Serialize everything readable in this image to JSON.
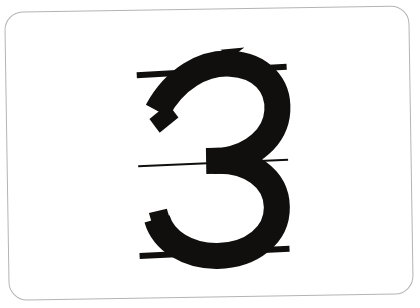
{
  "card": {
    "name": "handwriting-practice-flashcard",
    "subject": "numeral-3-stroke-order",
    "background_color": "#ffffff",
    "border_color": "#b4b4b4",
    "border_width": 1,
    "corner_radius": 18,
    "rotation_degrees": -0.9,
    "bounds": {
      "x": 7,
      "y": 9,
      "width": 404,
      "height": 288
    }
  },
  "glyph": {
    "character": "3",
    "label": "numeral-three",
    "color": "#100f0d",
    "stroke_width": 26,
    "bounds": {
      "x": 150,
      "y": 62,
      "width": 130,
      "height": 194
    }
  },
  "guide_lines": [
    {
      "name": "top-guide-line",
      "role": "ascender-line",
      "x1": 138,
      "y1": 74,
      "x2": 288,
      "y2": 68,
      "thickness": 6,
      "color": "#100f0d",
      "weight": "thick"
    },
    {
      "name": "middle-guide-line",
      "role": "midline",
      "x1": 138,
      "y1": 165,
      "x2": 288,
      "y2": 161,
      "thickness": 2,
      "color": "#100f0d",
      "weight": "thin"
    },
    {
      "name": "bottom-guide-line",
      "role": "baseline",
      "x1": 138,
      "y1": 255,
      "x2": 288,
      "y2": 250,
      "thickness": 6,
      "color": "#100f0d",
      "weight": "thick"
    }
  ],
  "stroke_arrow": {
    "name": "stroke-direction-arrow",
    "direction": "up-right",
    "color": "#100f0d",
    "shaft": {
      "x1": 166,
      "y1": 90,
      "x2": 232,
      "y2": 54
    },
    "shaft_thickness": 3,
    "head": {
      "tip_x": 243,
      "tip_y": 49,
      "size": 17
    },
    "order": 1
  },
  "colors": {
    "ink": "#100f0d",
    "paper": "#ffffff",
    "card_border": "#b4b4b4",
    "page_background": "#ffffff"
  },
  "accessibility": {
    "alt_text": "Handwriting practice card showing the numeral 3 between three guide lines, with an arrow indicating the starting stroke direction."
  }
}
